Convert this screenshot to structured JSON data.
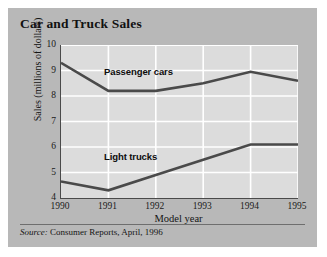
{
  "card": {
    "title": "Car and Truck Sales",
    "source_prefix": "Source:",
    "source_text": "Consumer Reports, April, 1996"
  },
  "colors": {
    "card_bg": "#b8b8b8",
    "plot_bg": "#dcdcdc",
    "gridline": "#ffffff",
    "axis": "#4a4a4a",
    "series_line": "#4a4a4a",
    "text": "#141414"
  },
  "chart_data": {
    "type": "line",
    "title": "Car and Truck Sales",
    "xlabel": "Model year",
    "ylabel": "Sales (millions of dollars)",
    "categories": [
      "1990",
      "1991",
      "1992",
      "1993",
      "1994",
      "1995"
    ],
    "x": [
      1990,
      1991,
      1992,
      1993,
      1994,
      1995
    ],
    "xlim": [
      1990,
      1995
    ],
    "ylim": [
      4,
      10
    ],
    "yticks": [
      4,
      5,
      6,
      7,
      8,
      9,
      10
    ],
    "xticks": [
      "1990",
      "1991",
      "1992",
      "1993",
      "1994",
      "1995"
    ],
    "grid": true,
    "legend": "inline-labels",
    "series": [
      {
        "name": "Passenger cars",
        "values": [
          9.3,
          8.2,
          8.2,
          8.5,
          8.95,
          8.6
        ],
        "label_position": "above-line"
      },
      {
        "name": "Light trucks",
        "values": [
          4.65,
          4.3,
          4.9,
          5.5,
          6.1,
          6.1
        ],
        "label_position": "above-line"
      }
    ],
    "annotations": [
      "Passenger cars",
      "Light trucks"
    ]
  }
}
